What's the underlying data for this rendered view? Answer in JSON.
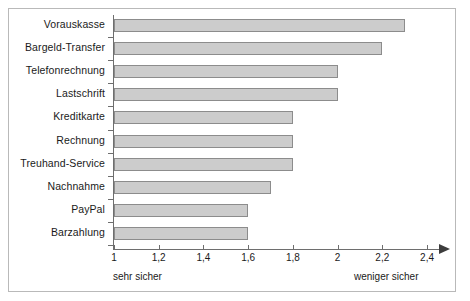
{
  "chart_data": {
    "type": "bar",
    "orientation": "horizontal",
    "title": "",
    "subtitle": "",
    "xlabel": "",
    "ylabel": "",
    "categories": [
      "Vorauskasse",
      "Bargeld-Transfer",
      "Telefonrechnung",
      "Lastschrift",
      "Kreditkarte",
      "Rechnung",
      "Treuhand-Service",
      "Nachnahme",
      "PayPal",
      "Barzahlung"
    ],
    "values": [
      2.3,
      2.2,
      2.0,
      2.0,
      1.8,
      1.8,
      1.8,
      1.7,
      1.6,
      1.6
    ],
    "xlim": [
      1,
      2.5
    ],
    "xticks": [
      1,
      1.2,
      1.4,
      1.6,
      1.8,
      2,
      2.2,
      2.4
    ],
    "xtick_labels": [
      "1",
      "1,2",
      "1,4",
      "1,6",
      "1,8",
      "2",
      "2,2",
      "2,4"
    ],
    "grid": false,
    "legend": null,
    "annotations": {
      "axis_low_label": "sehr sicher",
      "axis_high_label": "weniger sicher"
    },
    "colors": {
      "bar_fill": "#cccccc",
      "bar_border": "#8c8c8c",
      "axis": "#6e6e6e",
      "frame": "#b9b9b9",
      "text": "#1a1a1a",
      "background": "#ffffff"
    }
  }
}
